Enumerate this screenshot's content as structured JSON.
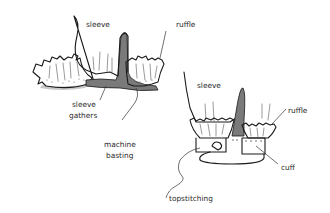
{
  "figure": {
    "colors": {
      "outline": "#1a1a1a",
      "fabric_fill": "#ffffff",
      "basting_fill": "#7a7a7a",
      "shadow_fill": "#bdbdbd"
    },
    "left_panel": {
      "labels": {
        "sleeve": "sleeve",
        "ruffle": "ruffle",
        "sleeve_gathers_line1": "sleeve",
        "sleeve_gathers_line2": "gathers",
        "machine_basting_line1": "machine",
        "machine_basting_line2": "basting"
      }
    },
    "right_panel": {
      "labels": {
        "sleeve": "sleeve",
        "ruffle": "ruffle",
        "cuff": "cuff",
        "topstitching": "topstitching"
      }
    }
  }
}
